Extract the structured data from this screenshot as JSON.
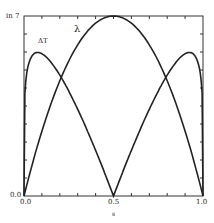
{
  "chart_data": {
    "type": "line",
    "title": "",
    "xlabel": "s",
    "ylabel": "",
    "xlim": [
      0.0,
      1.0
    ],
    "ylim": [
      0.0,
      1.0
    ],
    "x_ticks": [
      "0.0",
      "0.5",
      "1.0"
    ],
    "y_ticks": [
      "0.0",
      "in 7"
    ],
    "grid": false,
    "legend": "inline annotations",
    "series": [
      {
        "name": "λ",
        "x": [
          0.0,
          0.1,
          0.2,
          0.3,
          0.4,
          0.5,
          0.6,
          0.7,
          0.8,
          0.9,
          1.0
        ],
        "values": [
          0.0,
          0.36,
          0.64,
          0.84,
          0.96,
          1.0,
          0.96,
          0.84,
          0.64,
          0.36,
          0.0
        ]
      },
      {
        "name": "ΔT",
        "x": [
          0.0,
          0.02,
          0.07,
          0.1,
          0.2,
          0.3,
          0.4,
          0.5,
          0.6,
          0.7,
          0.8,
          0.9,
          0.93,
          0.98,
          1.0
        ],
        "values": [
          0.0,
          0.8,
          0.96,
          0.95,
          0.82,
          0.6,
          0.32,
          0.0,
          0.32,
          0.6,
          0.82,
          0.95,
          0.96,
          0.8,
          0.0
        ]
      }
    ],
    "annotations": [
      {
        "text": "ΔT",
        "x": 0.09,
        "y": 0.85
      },
      {
        "text": "λ",
        "x": 0.3,
        "y": 0.95
      }
    ]
  },
  "labels": {
    "y_top": "in 7",
    "y_bottom": "0.0",
    "x_left": "0.0",
    "x_mid": "0.5",
    "x_right": "1.0",
    "x_axis": "s",
    "series_dt": "ΔT",
    "series_lambda": "λ"
  }
}
